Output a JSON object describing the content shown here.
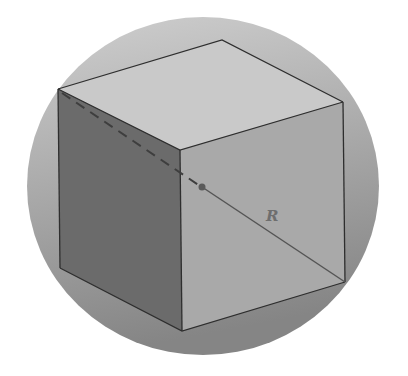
{
  "figure": {
    "type": "cube inscribed in sphere",
    "label": "R",
    "colors": {
      "background": "#ffffff",
      "sphere_top": "#cfcfcf",
      "sphere_bottom": "#858585",
      "top_face": "#c9c9c9",
      "left_face": "#6b6b6b",
      "right_face": "#a9a9a9",
      "edge": "#2e2e2e",
      "radius_line": "#555555",
      "label": "#6e6e6e",
      "center_dot": "#5a5a5a"
    },
    "sphere": {
      "cx": 203,
      "cy": 186,
      "rx": 176,
      "ry": 169
    },
    "vertices": {
      "top_back": [
        222,
        40
      ],
      "top_left": [
        58,
        89
      ],
      "top_right": [
        343,
        102
      ],
      "top_front": [
        180,
        150
      ],
      "bottom_left": [
        60,
        268
      ],
      "bottom_front": [
        182,
        331
      ],
      "bottom_right": [
        345,
        282
      ]
    },
    "center": [
      202,
      187
    ],
    "label_position": [
      272,
      221
    ]
  }
}
